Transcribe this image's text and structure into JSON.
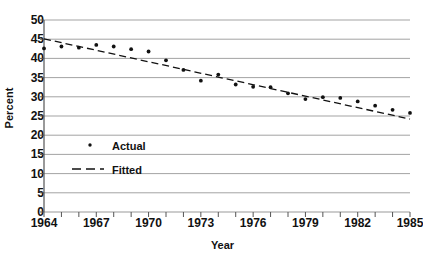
{
  "chart_data": {
    "type": "scatter",
    "title": "",
    "xlabel": "Year",
    "ylabel": "Percent",
    "xlim": [
      1964,
      1985
    ],
    "ylim": [
      0,
      50
    ],
    "ytick_step": 5,
    "yticks": [
      0,
      5,
      10,
      15,
      20,
      25,
      30,
      35,
      40,
      45,
      50
    ],
    "xticks": [
      1964,
      1965,
      1966,
      1967,
      1968,
      1969,
      1970,
      1971,
      1972,
      1973,
      1974,
      1975,
      1976,
      1977,
      1978,
      1979,
      1980,
      1981,
      1982,
      1983,
      1984,
      1985
    ],
    "xtick_labels": [
      1964,
      1967,
      1970,
      1973,
      1976,
      1979,
      1982,
      1985
    ],
    "grid": "horizontal",
    "legend_position": "inside-left",
    "series": [
      {
        "name": "Actual",
        "type": "scatter",
        "marker": "dot",
        "color": "#111111",
        "x": [
          1964,
          1965,
          1966,
          1967,
          1968,
          1969,
          1970,
          1971,
          1972,
          1973,
          1974,
          1975,
          1976,
          1977,
          1978,
          1979,
          1980,
          1981,
          1982,
          1983,
          1984,
          1985
        ],
        "values": [
          42.6,
          43.1,
          42.8,
          43.5,
          43.1,
          42.4,
          41.8,
          39.5,
          37.0,
          34.2,
          35.8,
          33.2,
          32.6,
          32.5,
          30.9,
          29.4,
          29.9,
          29.7,
          28.8,
          27.7,
          26.6,
          25.8
        ]
      },
      {
        "name": "Fitted",
        "type": "line",
        "style": "dashed",
        "color": "#111111",
        "x": [
          1964,
          1985
        ],
        "values": [
          45.1,
          24.2
        ]
      }
    ],
    "legend": [
      {
        "label": "Actual",
        "marker": "dot"
      },
      {
        "label": "Fitted",
        "marker": "dashed-line"
      }
    ]
  },
  "axis": {
    "y_title": "Percent",
    "x_title": "Year"
  }
}
